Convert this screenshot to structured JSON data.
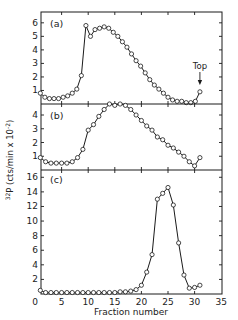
{
  "chart_data": {
    "type": "line",
    "title": "",
    "xlabel": "Fraction number",
    "ylabel": "32P (cts/min x 10-2)",
    "ylabel_parts": {
      "sup": "32",
      "main": "P (cts/min x 10",
      "exp": "-2",
      "close": ")"
    },
    "xlim": [
      0,
      35
    ],
    "x_ticks": [
      0,
      5,
      10,
      15,
      20,
      25,
      30,
      35
    ],
    "grid": false,
    "legend": null,
    "panels": [
      {
        "label": "(a)",
        "ylim": [
          0,
          6.8
        ],
        "y_ticks": [
          1,
          2,
          3,
          4,
          5,
          6
        ],
        "y_ticklabels": [
          "1",
          "2",
          "3",
          "4",
          "5",
          "6"
        ],
        "annotation": {
          "text": "Top",
          "x": 31,
          "arrow": true
        },
        "series": [
          {
            "name": "a",
            "x": [
              1,
              2,
              3,
              4,
              5,
              6,
              7,
              8,
              9,
              10,
              11,
              12,
              13,
              14,
              15,
              16,
              17,
              18,
              19,
              20,
              21,
              22,
              23,
              24,
              25,
              26,
              27,
              28,
              29,
              30,
              31
            ],
            "y": [
              0.8,
              0.5,
              0.4,
              0.4,
              0.4,
              0.5,
              0.6,
              0.8,
              1.1,
              2.1,
              5.8,
              5.0,
              5.5,
              5.6,
              5.7,
              5.6,
              5.3,
              5.0,
              4.6,
              4.2,
              3.7,
              3.2,
              2.8,
              2.3,
              1.8,
              1.4,
              1.1,
              0.8,
              0.5,
              0.3,
              0.2,
              0.2,
              0.1,
              0.1,
              0.2,
              0.9
            ]
          }
        ]
      },
      {
        "label": "(b)",
        "ylim": [
          0,
          4.8
        ],
        "y_ticks": [
          1,
          2,
          3,
          4
        ],
        "y_ticklabels": [
          "1",
          "2",
          "3",
          "4"
        ],
        "series": [
          {
            "name": "b",
            "x": [
              1,
              2,
              3,
              4,
              5,
              6,
              7,
              8,
              9,
              10,
              11,
              12,
              13,
              14,
              15,
              16,
              17,
              18,
              19,
              20,
              21,
              22,
              23,
              24,
              25,
              26,
              27,
              28,
              29,
              30,
              31
            ],
            "y": [
              0.9,
              0.6,
              0.5,
              0.5,
              0.5,
              0.5,
              0.6,
              0.9,
              1.5,
              2.9,
              3.3,
              3.9,
              4.4,
              4.8,
              4.7,
              4.8,
              4.7,
              4.4,
              4.0,
              3.6,
              3.2,
              2.9,
              2.4,
              2.2,
              1.8,
              1.6,
              1.3,
              1.0,
              0.6,
              0.3,
              0.9
            ]
          }
        ]
      },
      {
        "label": "(c)",
        "ylim": [
          0,
          17
        ],
        "y_ticks": [
          2,
          4,
          6,
          8,
          10,
          12,
          14,
          16
        ],
        "y_ticklabels": [
          "2",
          "4",
          "6",
          "8",
          "10",
          "12",
          "14",
          "16"
        ],
        "series": [
          {
            "name": "c",
            "x": [
              1,
              2,
              3,
              4,
              5,
              6,
              7,
              8,
              9,
              10,
              11,
              12,
              13,
              14,
              15,
              16,
              17,
              18,
              19,
              20,
              21,
              22,
              23,
              24,
              25,
              26,
              27,
              28,
              29,
              30,
              31
            ],
            "y": [
              0.5,
              0.2,
              0.2,
              0.2,
              0.2,
              0.2,
              0.2,
              0.2,
              0.2,
              0.2,
              0.2,
              0.2,
              0.2,
              0.2,
              0.2,
              0.3,
              0.3,
              0.4,
              0.6,
              1.2,
              3.0,
              5.4,
              13.0,
              13.8,
              14.6,
              12.2,
              7.0,
              2.6,
              0.8,
              0.9,
              1.2
            ]
          }
        ]
      }
    ]
  },
  "layout": {
    "plot_left": 41,
    "plot_right": 222,
    "x0_px": 35,
    "px_per_unit": 5.32,
    "panels_px": [
      {
        "top": 12,
        "bottom": 104
      },
      {
        "top": 104,
        "bottom": 170
      },
      {
        "top": 170,
        "bottom": 294
      }
    ]
  },
  "colors": {
    "ink": "#1a1a1a",
    "background": "#ffffff"
  }
}
